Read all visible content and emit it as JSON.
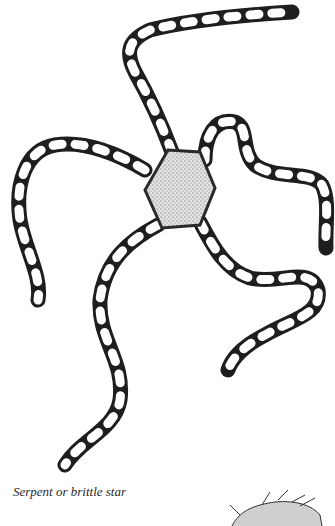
{
  "caption": "Serpent or brittle star",
  "colors": {
    "background": "#ffffff",
    "ink": "#1a1a1a",
    "disc": "#d8d8d8"
  }
}
